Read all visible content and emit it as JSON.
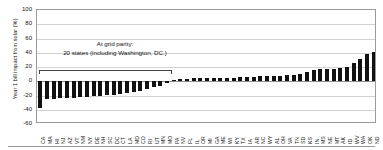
{
  "chart_data": {
    "type": "bar",
    "title": "",
    "xlabel": "",
    "ylabel": "Year 1 bill impact from solar (%)",
    "ylim": [
      -60,
      100
    ],
    "yticks": [
      100,
      80,
      60,
      40,
      20,
      0,
      -20,
      -40,
      -60
    ],
    "grid": true,
    "legend": null,
    "bar_color": "#111111",
    "categories": [
      "CA",
      "MA",
      "HI",
      "NJ",
      "AZ",
      "VT",
      "NM",
      "NY",
      "DE",
      "NH",
      "SC",
      "DC",
      "CT",
      "LA",
      "MD",
      "CO",
      "RI",
      "UT",
      "MN",
      "MO",
      "PA",
      "NV",
      "FL",
      "IL",
      "OR",
      "MI",
      "GA",
      "ME",
      "WI",
      "KY",
      "TX",
      "IA",
      "AR",
      "NC",
      "WY",
      "AL",
      "OH",
      "VA",
      "TN",
      "SD",
      "KS",
      "IN",
      "MS",
      "NE",
      "MT",
      "AK",
      "ID",
      "WV",
      "WA",
      "OK",
      "ND"
    ],
    "values": [
      -38,
      -25,
      -25,
      -24,
      -23,
      -23,
      -22,
      -22,
      -21,
      -20,
      -19,
      -19,
      -18,
      -17,
      -15,
      -13,
      -11,
      -8,
      -6,
      -3,
      2,
      3,
      3,
      4,
      4,
      4,
      5,
      5,
      5,
      5,
      6,
      6,
      6,
      7,
      7,
      7,
      8,
      9,
      9,
      10,
      13,
      16,
      17,
      17,
      17,
      18,
      20,
      26,
      31,
      38,
      41
    ],
    "annotations": [
      {
        "name": "grid-parity-annotation",
        "line1": "At grid parity:",
        "line2": "20 states (including Washington, DC.)",
        "bracket_from": "CA",
        "bracket_to": "MO",
        "bracket_count": 20
      }
    ]
  },
  "axis": {
    "y_title": "Year 1 bill impact from solar (%)",
    "y_tick_labels": [
      "100",
      "80",
      "60",
      "40",
      "20",
      "0",
      "-20",
      "-40",
      "-60"
    ]
  },
  "annotation": {
    "line1": "At grid parity:",
    "line2": "20 states (including Washington, DC.)"
  }
}
